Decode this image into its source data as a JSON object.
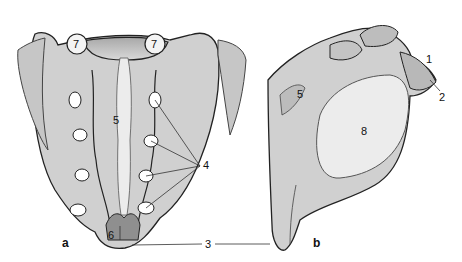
{
  "figure": {
    "views": [
      {
        "id": "a",
        "label": "a",
        "description": "posterior view"
      },
      {
        "id": "b",
        "label": "b",
        "description": "lateral view"
      }
    ],
    "callouts": {
      "c1": "1",
      "c2": "2",
      "c3": "3",
      "c4": "4",
      "c5a": "5",
      "c5b": "5",
      "c6": "6",
      "c7l": "7",
      "c7r": "7",
      "c8": "8"
    },
    "colors": {
      "bone": "#cfcfcf",
      "bone_light": "#e4e4e4",
      "bone_dark": "#9a9a9a",
      "outline": "#222222",
      "leader": "#333333"
    }
  }
}
